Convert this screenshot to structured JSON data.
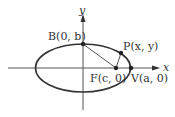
{
  "diagram": {
    "axes": {
      "x_label": "x",
      "y_label": "y"
    },
    "points": {
      "B": {
        "name": "B",
        "coords": "(0, b)",
        "px": [
          83,
          44
        ]
      },
      "P": {
        "name": "P",
        "coords": "(x, y)",
        "px": [
          121,
          53
        ]
      },
      "F": {
        "name": "F",
        "coords": "(c, 0)",
        "px": [
          116,
          68
        ]
      },
      "V": {
        "name": "V",
        "coords": "(a, 0)",
        "px": [
          131,
          68
        ]
      }
    },
    "labels": {
      "B": "B(0, b)",
      "P": "P(x, y)",
      "F": "F(c, 0)",
      "V": "V(a, 0)"
    },
    "segments": [
      "B-F",
      "F-P"
    ],
    "colors": {
      "stroke": "#333333",
      "axis": "#555555",
      "background": "#ffffff"
    }
  }
}
